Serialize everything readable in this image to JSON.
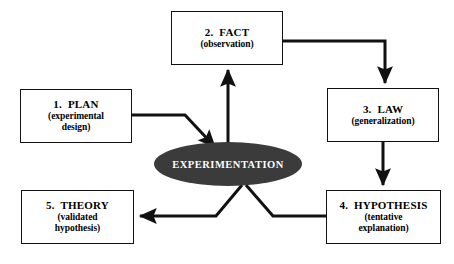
{
  "diagram": {
    "background_color": "#ffffff",
    "line_color": "#111111",
    "hub_fill_color": "#3b3b3b",
    "hub_text_color": "#ffffff",
    "box_border_color": "#111111",
    "box_fill_color": "#ffffff"
  },
  "hub": {
    "label": "EXPERIMENTATION",
    "cx": 228,
    "cy": 164,
    "rx": 74,
    "ry": 22
  },
  "nodes": [
    {
      "id": "plan",
      "title": "1.  PLAN",
      "sub_line1": "(experimental",
      "sub_line2": "design)",
      "x": 20,
      "y": 89,
      "w": 112,
      "h": 54
    },
    {
      "id": "fact",
      "title": "2.  FACT",
      "sub_line1": "(observation)",
      "sub_line2": "",
      "x": 171,
      "y": 11,
      "w": 112,
      "h": 54
    },
    {
      "id": "law",
      "title": "3.  LAW",
      "sub_line1": "(generalization)",
      "sub_line2": "",
      "x": 327,
      "y": 88,
      "w": 112,
      "h": 54
    },
    {
      "id": "hypothesis",
      "title": "4.  HYPOTHESIS",
      "sub_line1": "(tentative",
      "sub_line2": "explanation)",
      "x": 326,
      "y": 190,
      "w": 115,
      "h": 54
    },
    {
      "id": "theory",
      "title": "5.  THEORY",
      "sub_line1": "(validated",
      "sub_line2": "hypothesis)",
      "x": 21,
      "y": 190,
      "w": 113,
      "h": 54
    }
  ],
  "connectors": [
    {
      "id": "plan-to-hub",
      "from": "plan",
      "to": "hub",
      "arrowhead": "end",
      "path": "M 132,115 L 185,115 L 215,147"
    },
    {
      "id": "hub-to-fact",
      "from": "hub",
      "to": "fact",
      "arrowhead": "end",
      "path": "M 228,156 L 228,70"
    },
    {
      "id": "fact-to-law",
      "from": "fact",
      "to": "law",
      "arrowhead": "end",
      "path": "M 283,41 L 385,41 L 385,83"
    },
    {
      "id": "law-to-hypothesis",
      "from": "law",
      "to": "hypothesis",
      "arrowhead": "end",
      "path": "M 383,142 L 383,185"
    },
    {
      "id": "hypothesis-to-hub",
      "from": "hypothesis",
      "to": "hub",
      "arrowhead": "none",
      "path": "M 326,216 L 273,216 L 246,185"
    },
    {
      "id": "hub-to-theory",
      "from": "hub",
      "to": "theory",
      "arrowhead": "end",
      "path": "M 242,185 L 216,216 L 140,216"
    }
  ]
}
